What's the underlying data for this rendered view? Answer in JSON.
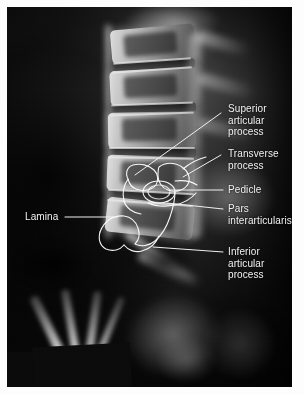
{
  "figure": {
    "modality": "x-ray",
    "view": "lateral lumbar spine radiograph",
    "background_color": "#050505",
    "page_color": "#fdfdfd",
    "overlay_color": "#ffffff",
    "label_color": "#f2f2f2"
  },
  "labels": [
    {
      "id": "superior-articular-process",
      "text": "Superior\narticular\nprocess"
    },
    {
      "id": "transverse-process",
      "text": "Transverse\nprocess"
    },
    {
      "id": "pedicle",
      "text": "Pedicle"
    },
    {
      "id": "pars-interarticularis",
      "text": "Pars\ninterarticularis"
    },
    {
      "id": "lamina",
      "text": "Lamina"
    },
    {
      "id": "inferior-articular-process",
      "text": "Inferior\narticular\nprocess"
    }
  ]
}
